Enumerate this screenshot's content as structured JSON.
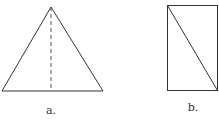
{
  "figures": [
    {
      "id": "a",
      "shape": "triangle",
      "label": "a.",
      "note": "isosceles triangle with dashed altitude from apex to base"
    },
    {
      "id": "b",
      "shape": "rectangle",
      "label": "b.",
      "note": "rectangle with diagonal from top-left to bottom-right"
    }
  ],
  "colors": {
    "stroke": "#333333",
    "background": "#ffffff"
  }
}
